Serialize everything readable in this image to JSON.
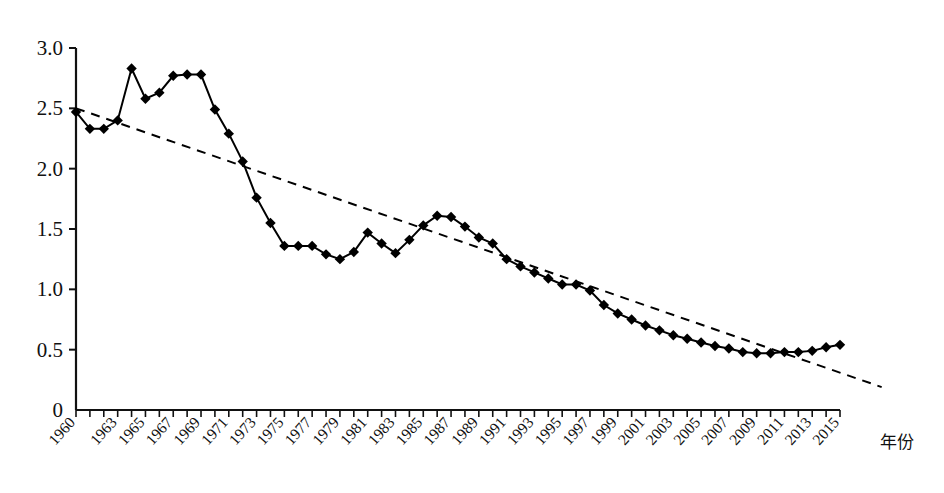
{
  "chart_data": {
    "type": "line",
    "title": "",
    "subtitle": "",
    "xlabel": "年份",
    "ylabel": "",
    "xlim": [
      1960,
      2015
    ],
    "ylim": [
      0,
      3.0
    ],
    "grid": false,
    "legend_position": "none",
    "y_ticks": [
      "0",
      "0.5",
      "1.0",
      "1.5",
      "2.0",
      "2.5",
      "3.0"
    ],
    "y_tick_values": [
      0,
      0.5,
      1.0,
      1.5,
      2.0,
      2.5,
      3.0
    ],
    "x_tick_labels": [
      "1960",
      "1963",
      "1965",
      "1967",
      "1969",
      "1971",
      "1973",
      "1975",
      "1977",
      "1979",
      "1981",
      "1983",
      "1985",
      "1987",
      "1989",
      "1991",
      "1993",
      "1995",
      "1997",
      "1999",
      "2001",
      "2003",
      "2005",
      "2007",
      "2009",
      "2011",
      "2013",
      "2015"
    ],
    "x": [
      1960,
      1961,
      1962,
      1963,
      1964,
      1965,
      1966,
      1967,
      1968,
      1969,
      1970,
      1971,
      1972,
      1973,
      1974,
      1975,
      1976,
      1977,
      1978,
      1979,
      1980,
      1981,
      1982,
      1983,
      1984,
      1985,
      1986,
      1987,
      1988,
      1989,
      1990,
      1991,
      1992,
      1993,
      1994,
      1995,
      1996,
      1997,
      1998,
      1999,
      2000,
      2001,
      2002,
      2003,
      2004,
      2005,
      2006,
      2007,
      2008,
      2009,
      2010,
      2011,
      2012,
      2013,
      2014,
      2015
    ],
    "series": [
      {
        "name": "观测值",
        "style": "solid-with-diamond-markers",
        "color": "#000000",
        "values": [
          2.47,
          2.33,
          2.33,
          2.4,
          2.83,
          2.58,
          2.63,
          2.77,
          2.78,
          2.78,
          2.49,
          2.29,
          2.06,
          1.76,
          1.55,
          1.36,
          1.36,
          1.36,
          1.29,
          1.25,
          1.31,
          1.47,
          1.38,
          1.3,
          1.41,
          1.53,
          1.61,
          1.6,
          1.52,
          1.43,
          1.38,
          1.25,
          1.19,
          1.14,
          1.09,
          1.04,
          1.04,
          0.99,
          0.87,
          0.8,
          0.75,
          0.7,
          0.66,
          0.62,
          0.59,
          0.56,
          0.53,
          0.51,
          0.48,
          0.47,
          0.47,
          0.48,
          0.48,
          0.49,
          0.52,
          0.54
        ]
      },
      {
        "name": "趋势线",
        "style": "dashed",
        "color": "#000000",
        "trend_from": {
          "x": 1960,
          "y": 2.5
        },
        "trend_to": {
          "x": 2018,
          "y": 0.19
        }
      }
    ]
  },
  "axis": {
    "y_axis_name": "value-axis",
    "x_axis_name": "year-axis",
    "x_axis_title": "年份"
  }
}
